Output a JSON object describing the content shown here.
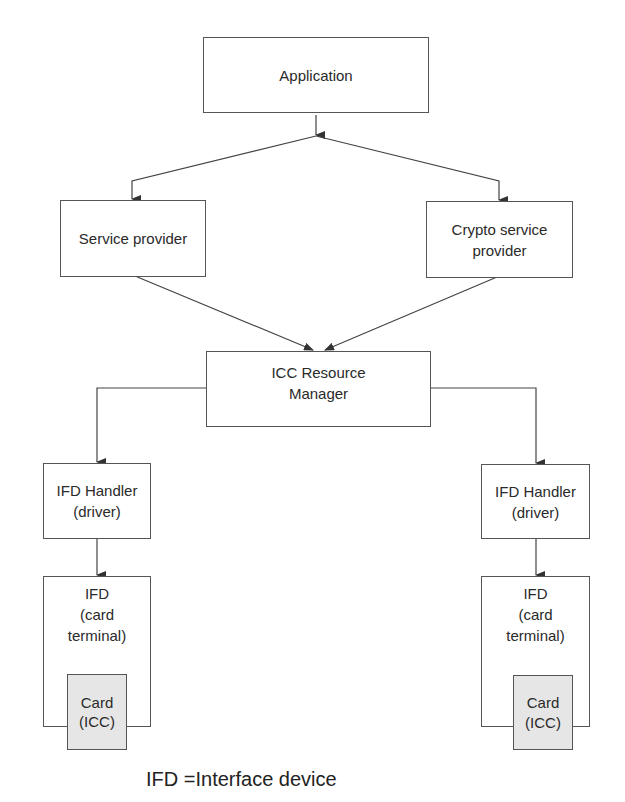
{
  "diagram": {
    "title": "",
    "nodes": {
      "application": "Application",
      "service_provider": "Service provider",
      "crypto_service_provider": "Crypto service\nprovider",
      "icc_resource_manager": "ICC Resource\nManager",
      "ifd_handler_left": "IFD Handler\n(driver)",
      "ifd_handler_right": "IFD Handler\n(driver)",
      "ifd_left": "IFD\n(card\nterminal)",
      "ifd_right": "IFD\n(card\nterminal)",
      "card_left": "Card\n(ICC)",
      "card_right": "Card\n(ICC)"
    },
    "edges": [
      {
        "from": "Application",
        "to": "Service provider"
      },
      {
        "from": "Application",
        "to": "Crypto service provider"
      },
      {
        "from": "Service provider",
        "to": "ICC Resource Manager"
      },
      {
        "from": "Crypto service provider",
        "to": "ICC Resource Manager"
      },
      {
        "from": "ICC Resource Manager",
        "to": "IFD Handler (driver) left"
      },
      {
        "from": "ICC Resource Manager",
        "to": "IFD Handler (driver) right"
      },
      {
        "from": "IFD Handler (driver) left",
        "to": "IFD (card terminal) left"
      },
      {
        "from": "IFD Handler (driver) right",
        "to": "IFD (card terminal) right"
      }
    ],
    "footer": "IFD =Interface device",
    "colors": {
      "stroke": "#555555",
      "card_fill": "#e6e6e6"
    }
  }
}
